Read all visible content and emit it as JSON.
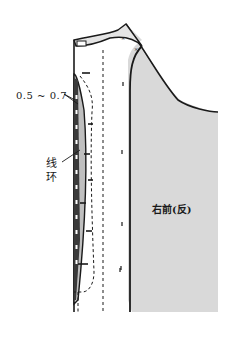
{
  "diagram": {
    "type": "garment-sewing-pattern",
    "labels": {
      "dimension": "0.5 ~ 0.7",
      "thread_loop_line1": "线",
      "thread_loop_line2": "环",
      "piece_name": "右前(反)"
    },
    "colors": {
      "outline": "#1a1a1a",
      "fill_gray": "#d9d9d9",
      "dark_facing": "#3a3a3a",
      "background": "#ffffff"
    }
  }
}
